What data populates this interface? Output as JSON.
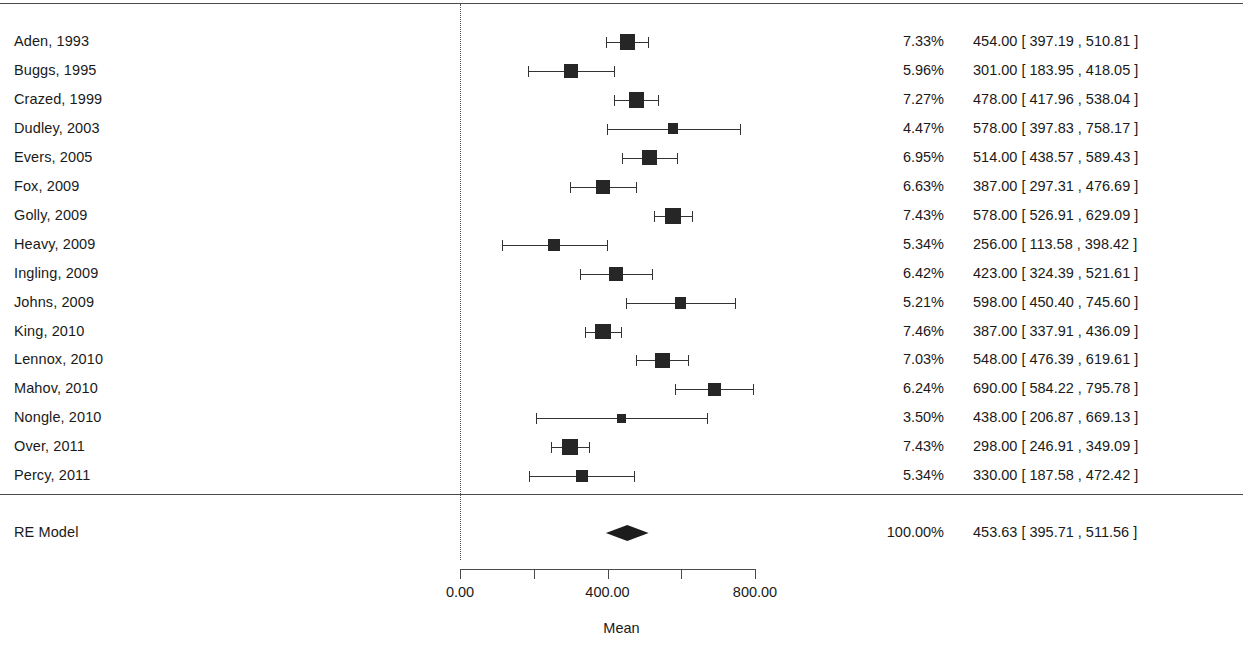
{
  "chart_data": {
    "type": "forest",
    "title": "",
    "xlabel": "Mean",
    "ylabel": "",
    "xlim": [
      0,
      800
    ],
    "axis_ticks": [
      {
        "value": 0,
        "label": "0.00",
        "show_label": true
      },
      {
        "value": 200,
        "label": "200.00",
        "show_label": false
      },
      {
        "value": 400,
        "label": "400.00",
        "show_label": true
      },
      {
        "value": 600,
        "label": "600.00",
        "show_label": false
      },
      {
        "value": 800,
        "label": "800.00",
        "show_label": true
      }
    ],
    "reference_line": 0,
    "grid": false,
    "legend": "none",
    "columns": [
      "Study",
      "Weight",
      "Mean [95% CI]"
    ],
    "studies": [
      {
        "label": "Aden, 1993",
        "weight": "7.33%",
        "weight_value": 7.33,
        "estimate": 454.0,
        "ci_low": 397.19,
        "ci_high": 510.81,
        "ci_text": "454.00 [ 397.19 , 510.81 ]"
      },
      {
        "label": "Buggs, 1995",
        "weight": "5.96%",
        "weight_value": 5.96,
        "estimate": 301.0,
        "ci_low": 183.95,
        "ci_high": 418.05,
        "ci_text": "301.00 [ 183.95 , 418.05 ]"
      },
      {
        "label": "Crazed, 1999",
        "weight": "7.27%",
        "weight_value": 7.27,
        "estimate": 478.0,
        "ci_low": 417.96,
        "ci_high": 538.04,
        "ci_text": "478.00 [ 417.96 , 538.04 ]"
      },
      {
        "label": "Dudley, 2003",
        "weight": "4.47%",
        "weight_value": 4.47,
        "estimate": 578.0,
        "ci_low": 397.83,
        "ci_high": 758.17,
        "ci_text": "578.00 [ 397.83 , 758.17 ]"
      },
      {
        "label": "Evers, 2005",
        "weight": "6.95%",
        "weight_value": 6.95,
        "estimate": 514.0,
        "ci_low": 438.57,
        "ci_high": 589.43,
        "ci_text": "514.00 [ 438.57 , 589.43 ]"
      },
      {
        "label": "Fox, 2009",
        "weight": "6.63%",
        "weight_value": 6.63,
        "estimate": 387.0,
        "ci_low": 297.31,
        "ci_high": 476.69,
        "ci_text": "387.00 [ 297.31 , 476.69 ]"
      },
      {
        "label": "Golly, 2009",
        "weight": "7.43%",
        "weight_value": 7.43,
        "estimate": 578.0,
        "ci_low": 526.91,
        "ci_high": 629.09,
        "ci_text": "578.00 [ 526.91 , 629.09 ]"
      },
      {
        "label": "Heavy, 2009",
        "weight": "5.34%",
        "weight_value": 5.34,
        "estimate": 256.0,
        "ci_low": 113.58,
        "ci_high": 398.42,
        "ci_text": "256.00 [ 113.58 , 398.42 ]"
      },
      {
        "label": "Ingling, 2009",
        "weight": "6.42%",
        "weight_value": 6.42,
        "estimate": 423.0,
        "ci_low": 324.39,
        "ci_high": 521.61,
        "ci_text": "423.00 [ 324.39 , 521.61 ]"
      },
      {
        "label": "Johns, 2009",
        "weight": "5.21%",
        "weight_value": 5.21,
        "estimate": 598.0,
        "ci_low": 450.4,
        "ci_high": 745.6,
        "ci_text": "598.00 [ 450.40 , 745.60 ]"
      },
      {
        "label": "King, 2010",
        "weight": "7.46%",
        "weight_value": 7.46,
        "estimate": 387.0,
        "ci_low": 337.91,
        "ci_high": 436.09,
        "ci_text": "387.00 [ 337.91 , 436.09 ]"
      },
      {
        "label": "Lennox, 2010",
        "weight": "7.03%",
        "weight_value": 7.03,
        "estimate": 548.0,
        "ci_low": 476.39,
        "ci_high": 619.61,
        "ci_text": "548.00 [ 476.39 , 619.61 ]"
      },
      {
        "label": "Mahov, 2010",
        "weight": "6.24%",
        "weight_value": 6.24,
        "estimate": 690.0,
        "ci_low": 584.22,
        "ci_high": 795.78,
        "ci_text": "690.00 [ 584.22 , 795.78 ]"
      },
      {
        "label": "Nongle, 2010",
        "weight": "3.50%",
        "weight_value": 3.5,
        "estimate": 438.0,
        "ci_low": 206.87,
        "ci_high": 669.13,
        "ci_text": "438.00 [ 206.87 , 669.13 ]"
      },
      {
        "label": "Over, 2011",
        "weight": "7.43%",
        "weight_value": 7.43,
        "estimate": 298.0,
        "ci_low": 246.91,
        "ci_high": 349.09,
        "ci_text": "298.00 [ 246.91 , 349.09 ]"
      },
      {
        "label": "Percy, 2011",
        "weight": "5.34%",
        "weight_value": 5.34,
        "estimate": 330.0,
        "ci_low": 187.58,
        "ci_high": 472.42,
        "ci_text": "330.00 [ 187.58 , 472.42 ]"
      }
    ],
    "summary": {
      "label": "RE Model",
      "weight": "100.00%",
      "estimate": 453.63,
      "ci_low": 395.71,
      "ci_high": 511.56,
      "ci_text": "453.63 [ 395.71 , 511.56 ]"
    }
  },
  "layout": {
    "x_pixel_at_zero": 460,
    "x_pixel_at_max": 755,
    "first_row_y": 33,
    "row_spacing": 28.95,
    "summary_row_y": 524,
    "rule_top_y": 3,
    "rule_mid_y": 494,
    "axis_y": 569
  },
  "colors": {
    "marker": "#262626",
    "line": "#333333",
    "rule": "#4a4a4a",
    "text": "#1a1a1a",
    "background": "#ffffff"
  }
}
